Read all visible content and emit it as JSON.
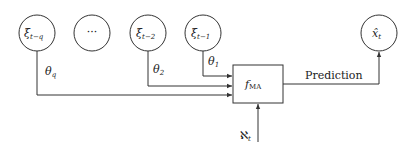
{
  "diagram": {
    "nodes": [
      {
        "id": "xi_t_minus_q",
        "label": "ξ",
        "sub": "t−q"
      },
      {
        "id": "ellipsis",
        "label": "···"
      },
      {
        "id": "xi_t_minus_2",
        "label": "ξ",
        "sub": "t−2"
      },
      {
        "id": "xi_t_minus_1",
        "label": "ξ",
        "sub": "t−1"
      },
      {
        "id": "x_hat_t",
        "label": "x̂",
        "sub": "t"
      }
    ],
    "function_box": {
      "label": "f",
      "sub": "MA"
    },
    "edge_labels": {
      "theta_q": {
        "label": "θ",
        "sub": "q"
      },
      "theta_2": {
        "label": "θ",
        "sub": "2"
      },
      "theta_1": {
        "label": "θ",
        "sub": "1"
      },
      "noise": {
        "label": "ℵ",
        "sub": "t"
      },
      "prediction": "Prediction"
    },
    "colors": {
      "stroke": "#333333",
      "text": "#222222",
      "background": "#ffffff"
    }
  }
}
